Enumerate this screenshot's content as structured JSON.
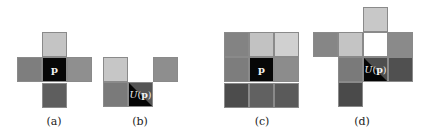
{
  "figure": {
    "panels": [
      {
        "id": "a",
        "caption": "(a)",
        "caption_x": 54,
        "cells": [
          {
            "x": 42,
            "y": 32,
            "color": "#c4c4c4"
          },
          {
            "x": 17,
            "y": 57,
            "color": "#7e7e7e"
          },
          {
            "x": 42,
            "y": 57,
            "color": "#070707",
            "label": "p"
          },
          {
            "x": 67,
            "y": 57,
            "color": "#8f8f8f"
          },
          {
            "x": 42,
            "y": 83,
            "color": "#5e5e5e"
          }
        ]
      },
      {
        "id": "b",
        "caption": "(b)",
        "caption_x": 140,
        "cells": [
          {
            "x": 103,
            "y": 57,
            "color": "#c6c6c6"
          },
          {
            "x": 153,
            "y": 57,
            "color": "#8e8e8e"
          },
          {
            "x": 103,
            "y": 82,
            "color": "#7a7a7a"
          },
          {
            "x": 128,
            "y": 82,
            "color": "#555555",
            "split_color": "#050505",
            "label": "U(p)",
            "italic": true
          }
        ]
      },
      {
        "id": "c",
        "caption": "(c)",
        "caption_x": 262,
        "cells": [
          {
            "x": 224,
            "y": 32,
            "color": "#838383"
          },
          {
            "x": 249,
            "y": 32,
            "color": "#c2c2c2"
          },
          {
            "x": 274,
            "y": 32,
            "color": "#d0d0d0"
          },
          {
            "x": 224,
            "y": 57,
            "color": "#7d7d7d"
          },
          {
            "x": 249,
            "y": 57,
            "color": "#070707",
            "label": "p"
          },
          {
            "x": 274,
            "y": 57,
            "color": "#8c8c8c"
          },
          {
            "x": 224,
            "y": 83,
            "color": "#4c4c4c"
          },
          {
            "x": 249,
            "y": 83,
            "color": "#616161"
          },
          {
            "x": 274,
            "y": 83,
            "color": "#5a5a5a"
          }
        ]
      },
      {
        "id": "d",
        "caption": "(d)",
        "caption_x": 362,
        "cells": [
          {
            "x": 363,
            "y": 7,
            "color": "#c8c8c8"
          },
          {
            "x": 313,
            "y": 32,
            "color": "#868686"
          },
          {
            "x": 338,
            "y": 32,
            "color": "#c4c4c4"
          },
          {
            "x": 363,
            "y": 32,
            "color": "#ffffff"
          },
          {
            "x": 388,
            "y": 32,
            "color": "#8a8a8a"
          },
          {
            "x": 338,
            "y": 57,
            "color": "#7a7a7a"
          },
          {
            "x": 363,
            "y": 57,
            "color": "#4e4e4e",
            "split_color": "#050505",
            "label": "U(p)",
            "italic": true
          },
          {
            "x": 388,
            "y": 57,
            "color": "#505050"
          },
          {
            "x": 338,
            "y": 82,
            "color": "#4a4a4a"
          }
        ]
      }
    ]
  }
}
